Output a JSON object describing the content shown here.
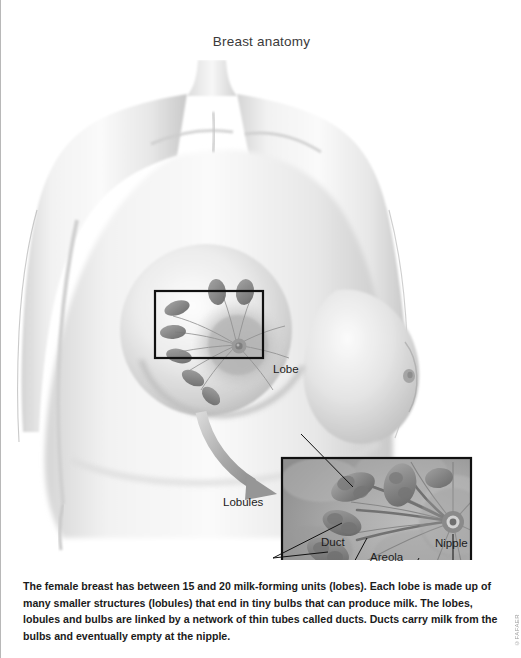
{
  "page": {
    "title": "Breast anatomy",
    "background_color": "#ffffff",
    "border_color": "#b8b8b8"
  },
  "illustration": {
    "description": "Grayscale medical illustration of a female torso with a rectangular selection over the left breast, a curved arrow leading to a magnified inset showing internal breast structures",
    "selection_rect": {
      "x": 154,
      "y": 231,
      "width": 108,
      "height": 67
    },
    "inset_rect": {
      "x": 281,
      "y": 398,
      "width": 189,
      "height": 120
    },
    "arrow": {
      "from_x": 205,
      "from_y": 355,
      "to_x": 278,
      "to_y": 432
    },
    "skin_tone": "#e9e9e9",
    "shadow_tone": "#b6b6b6",
    "tissue_tone": "#9b9b9b",
    "outline_color": "#1c1c1c"
  },
  "labels": [
    {
      "id": "lobe",
      "text": "Lobe"
    },
    {
      "id": "lobules",
      "text": "Lobules"
    },
    {
      "id": "duct",
      "text": "Duct"
    },
    {
      "id": "areola",
      "text": "Areola"
    },
    {
      "id": "nipple",
      "text": "Nipple"
    }
  ],
  "caption": {
    "text": "The female breast has between 15 and 20 milk-forming units (lobes). Each lobe is made up of many smaller structures (lobules) that end in tiny bulbs that can produce milk. The lobes, lobules and bulbs are linked by a network of thin tubes called ducts. Ducts carry milk from the bulbs and eventually empty at the nipple."
  },
  "credit": {
    "text": "©FAFAER"
  }
}
